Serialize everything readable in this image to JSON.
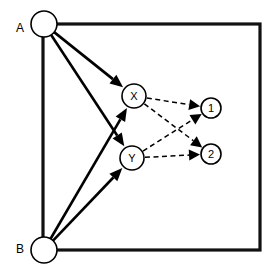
{
  "figure": {
    "background_color": "#ffffff",
    "stroke_color": "#000000",
    "boundary_color": "#111111",
    "width": 277,
    "height": 277
  },
  "boundary": {
    "name": "enclosing-rectangle",
    "x": 43,
    "y": 24,
    "width": 217,
    "height": 226
  },
  "nodes": [
    {
      "id": "A",
      "label": "A",
      "cx": 44,
      "cy": 24,
      "r": 13,
      "label_position": "outside-left",
      "label_x": 20,
      "label_y": 28
    },
    {
      "id": "B",
      "label": "B",
      "cx": 44,
      "cy": 250,
      "r": 13,
      "label_position": "outside-left",
      "label_x": 20,
      "label_y": 249
    },
    {
      "id": "X",
      "label": "X",
      "cx": 134,
      "cy": 96,
      "r": 12,
      "label_position": "inside",
      "label_x": 134,
      "label_y": 96
    },
    {
      "id": "Y",
      "label": "Y",
      "cx": 132,
      "cy": 158,
      "r": 12,
      "label_position": "inside",
      "label_x": 132,
      "label_y": 158
    },
    {
      "id": "1",
      "label": "1",
      "cx": 211,
      "cy": 108,
      "r": 10,
      "label_position": "inside",
      "label_x": 211,
      "label_y": 108
    },
    {
      "id": "2",
      "label": "2",
      "cx": 211,
      "cy": 154,
      "r": 10,
      "label_position": "inside",
      "label_x": 211,
      "label_y": 154
    }
  ],
  "edges": [
    {
      "name": "edge-a-to-x",
      "from": "A",
      "to": "X",
      "style": "solid",
      "arrow": true
    },
    {
      "name": "edge-a-to-y",
      "from": "A",
      "to": "Y",
      "style": "solid",
      "arrow": true
    },
    {
      "name": "edge-b-to-x",
      "from": "B",
      "to": "X",
      "style": "solid",
      "arrow": true
    },
    {
      "name": "edge-b-to-y",
      "from": "B",
      "to": "Y",
      "style": "solid",
      "arrow": true
    },
    {
      "name": "edge-x-to-1",
      "from": "X",
      "to": "1",
      "style": "dashed",
      "arrow": true
    },
    {
      "name": "edge-x-to-2",
      "from": "X",
      "to": "2",
      "style": "dashed",
      "arrow": true
    },
    {
      "name": "edge-y-to-1",
      "from": "Y",
      "to": "1",
      "style": "dashed",
      "arrow": true
    },
    {
      "name": "edge-y-to-2",
      "from": "Y",
      "to": "2",
      "style": "dashed",
      "arrow": true
    }
  ]
}
